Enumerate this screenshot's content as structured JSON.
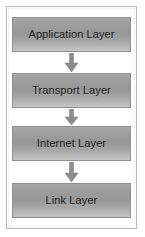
{
  "diagram": {
    "frame": {
      "border_color": "#b9b9b9",
      "background": "#ffffff"
    },
    "box_style": {
      "fill_top": "#a8a8a8",
      "fill_bottom": "#c4c4c4",
      "border_color": "#8f8f8f",
      "text_color": "#191919"
    },
    "arrow_style": {
      "color": "#8c8c8c",
      "direction": "down"
    },
    "layers": [
      {
        "label": "Application Layer",
        "order": 1
      },
      {
        "label": "Transport Layer",
        "order": 2
      },
      {
        "label": "Internet Layer",
        "order": 3
      },
      {
        "label": "Link Layer",
        "order": 4
      }
    ],
    "connectors": [
      {
        "from": "Application Layer",
        "to": "Transport Layer",
        "glyph": "arrow-down-icon"
      },
      {
        "from": "Transport Layer",
        "to": "Internet Layer",
        "glyph": "arrow-down-icon"
      },
      {
        "from": "Internet Layer",
        "to": "Link Layer",
        "glyph": "arrow-down-icon"
      }
    ]
  }
}
